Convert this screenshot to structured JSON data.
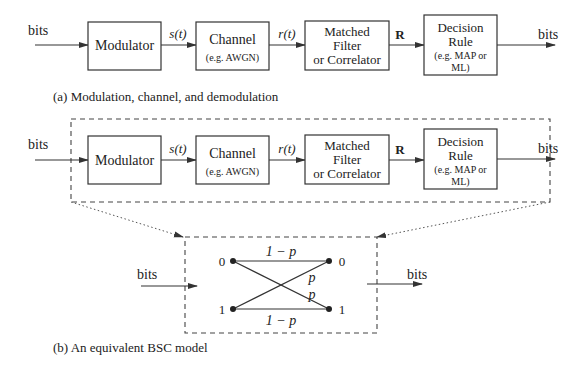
{
  "part_a": {
    "caption": "(a) Modulation, channel, and demodulation",
    "input_label": "bits",
    "output_label": "bits",
    "blocks": [
      {
        "lines": [
          "Modulator"
        ],
        "sub": []
      },
      {
        "lines": [
          "Channel"
        ],
        "sub": [
          "(e.g. AWGN)"
        ]
      },
      {
        "lines": [
          "Matched",
          "Filter",
          "or Correlator"
        ],
        "sub": []
      },
      {
        "lines": [
          "Decision",
          "Rule"
        ],
        "sub": [
          "(e.g. MAP or",
          "ML)"
        ]
      }
    ],
    "signals": [
      "s(t)",
      "r(t)",
      "R"
    ]
  },
  "part_b": {
    "caption": "(b) An equivalent BSC model",
    "input_label": "bits",
    "output_label": "bits",
    "bsc": {
      "left_nodes": [
        "0",
        "1"
      ],
      "right_nodes": [
        "0",
        "1"
      ],
      "top_label": "1 − p",
      "bottom_label": "1 − p",
      "cross_label_1": "p",
      "cross_label_2": "p"
    }
  }
}
